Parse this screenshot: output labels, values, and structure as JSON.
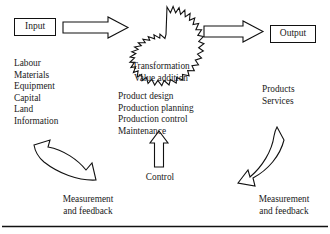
{
  "diagram": {
    "nodes": {
      "input_label": "Input",
      "output_label": "Output"
    },
    "lists": {
      "inputs": "Labour\nMaterials\nEquipment\nCapital\nLand\nInformation",
      "transformation": "Transformation\nValue addition",
      "activities": "Product design\nProduction planning\nProduction control\nMaintenance",
      "outputs": "Products\nServices"
    },
    "labels": {
      "control": "Control",
      "feedback_left": "Measurement\nand feedback",
      "feedback_right": "Measurement\nand feedback"
    },
    "colors": {
      "stroke": "#111111",
      "fill": "#ffffff",
      "text": "#1a1a1a"
    },
    "shapes": {
      "arrow_input_to_transform": "block-arrow-right",
      "arrow_transform_to_output": "block-arrow-right",
      "arrow_control": "block-arrow-up",
      "transformation_burst": "starburst-sun",
      "feedback_left_arrow": "curved-arrow-left",
      "feedback_right_arrow": "curved-arrow-down-left",
      "bottom_rule": "horizontal-rule"
    }
  }
}
